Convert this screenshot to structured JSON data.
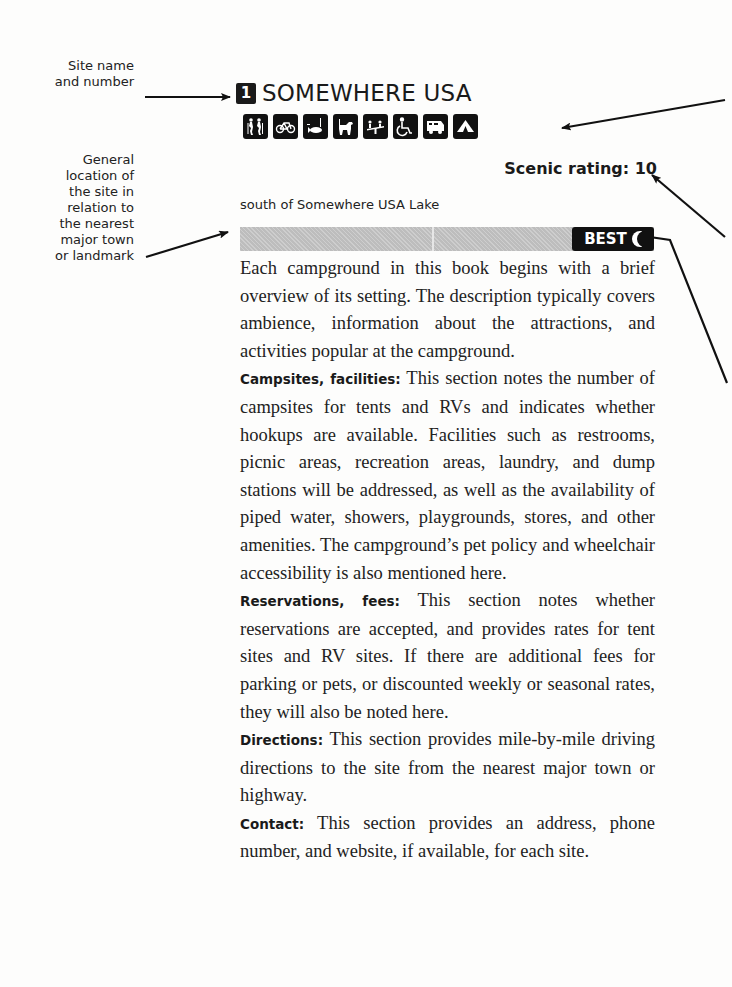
{
  "callouts": {
    "site_name": [
      "Site name",
      "and number"
    ],
    "general_location": [
      "General",
      "location of",
      "the site in",
      "relation to",
      "the nearest",
      "major town",
      "or landmark"
    ]
  },
  "site": {
    "number": "1",
    "name": "SOMEWHERE USA",
    "amenity_icons": [
      "hiking-icon",
      "biking-icon",
      "fishing-icon",
      "pets-icon",
      "playground-icon",
      "wheelchair-icon",
      "rv-icon",
      "tent-icon"
    ],
    "scenic_rating_label": "Scenic rating: 10",
    "location": "south of Somewhere USA Lake",
    "badge": "BEST"
  },
  "body": {
    "intro": "Each campground in this book begins with a brief overview of its setting. The description typically covers ambience, information about the attractions, and activities popular at the campground.",
    "sections": [
      {
        "label": "Campsites, facilities:",
        "text": " This section notes the number of campsites for tents and RVs and indicates whether hookups are available. Facilities such as restrooms, picnic areas, recreation areas, laundry, and dump stations will be addressed, as well as the availability of piped water, showers, playgrounds, stores, and other amenities. The campground’s pet policy and wheelchair accessibility is also mentioned here."
      },
      {
        "label": "Reservations, fees:",
        "text": " This section notes whether reservations are accepted, and provides rates for tent sites and RV sites. If there are additional fees for parking or pets, or discounted weekly or seasonal rates, they will also be noted here."
      },
      {
        "label": "Directions:",
        "text": " This section provides mile-by-mile driving directions to the site from the nearest major town or highway."
      },
      {
        "label": "Contact:",
        "text": " This section provides an address, phone number, and website, if available, for each site."
      }
    ]
  }
}
